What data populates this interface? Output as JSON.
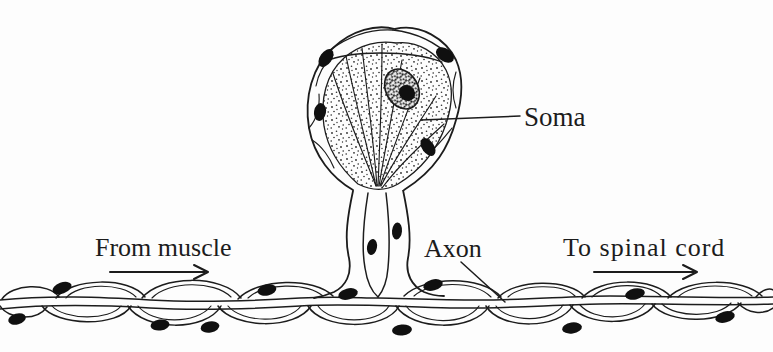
{
  "figure": {
    "background_color": "#fdfdfd",
    "ink_color": "#1c1c1c"
  },
  "labels": {
    "soma": "Soma",
    "axon": "Axon",
    "from_muscle": "From muscle",
    "to_spinal_cord": "To spinal cord"
  },
  "parts": [
    "soma",
    "nucleus",
    "nucleolus",
    "satellite-cell-nuclei",
    "axon-initial-segment",
    "peripheral-nerve-fiber",
    "myelin-sheath-segments",
    "schwann-cell-nuclei"
  ]
}
